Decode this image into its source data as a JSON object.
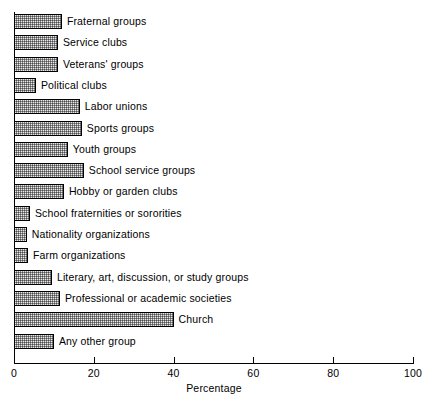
{
  "chart_data": {
    "type": "bar",
    "orientation": "horizontal",
    "title": "",
    "xlabel": "Percentage",
    "ylabel": "",
    "xlim": [
      0,
      100
    ],
    "xticks": [
      0,
      20,
      40,
      60,
      80,
      100
    ],
    "xtick_labels": [
      "0",
      "20",
      "40",
      "60",
      "80",
      "100"
    ],
    "grid": false,
    "legend": null,
    "categories": [
      "Fraternal groups",
      "Service clubs",
      "Veterans' groups",
      "Political clubs",
      "Labor unions",
      "Sports groups",
      "Youth groups",
      "School service groups",
      "Hobby or garden clubs",
      "School fraternities or sororities",
      "Nationality organizations",
      "Farm organizations",
      "Literary, art, discussion, or study groups",
      "Professional or academic societies",
      "Church",
      "Any other group"
    ],
    "values": [
      12,
      11,
      11,
      5.5,
      16.5,
      17,
      13.5,
      17.5,
      12.5,
      4,
      3.2,
      3.5,
      9.5,
      11.5,
      40,
      10
    ]
  },
  "axis": {
    "x_title": "Percentage"
  }
}
